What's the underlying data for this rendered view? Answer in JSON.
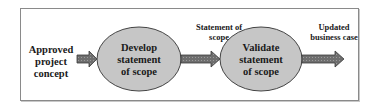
{
  "diagram": {
    "type": "process-flow",
    "input": {
      "label_lines": [
        "Approved",
        "project",
        "concept"
      ]
    },
    "nodes": [
      {
        "id": "develop",
        "label_lines": [
          "Develop",
          "statement",
          "of scope"
        ]
      },
      {
        "id": "validate",
        "label_lines": [
          "Validate",
          "statement",
          "of scope"
        ]
      }
    ],
    "edges": [
      {
        "from": "input",
        "to": "develop",
        "label_lines": []
      },
      {
        "from": "develop",
        "to": "validate",
        "label_lines": [
          "Statement of",
          "scope"
        ]
      },
      {
        "from": "validate",
        "to": "output",
        "label_lines": [
          "Updated",
          "business case"
        ]
      }
    ],
    "colors": {
      "node_fill": "#c6c6c6",
      "node_stroke": "#444444",
      "arrow_fill": "#707070",
      "arrow_stroke": "#3a3a3a",
      "frame_border": "#8a8a8a",
      "text": "#1a1a1a"
    }
  }
}
